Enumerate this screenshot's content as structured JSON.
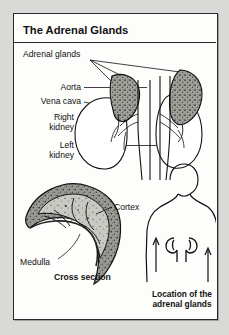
{
  "figure": {
    "title": "The Adrenal Glands",
    "background_color": "#d9d9d7",
    "panel_color": "#fdfdfc",
    "ink_color": "#111111",
    "tissue_fill": "#9a9a96"
  },
  "labels": {
    "adrenal_glands": "Adrenal glands",
    "aorta": "Aorta",
    "vena_cava": "Vena cava",
    "right_kidney_line1": "Right",
    "right_kidney_line2": "kidney",
    "left_kidney_line1": "Left",
    "left_kidney_line2": "kidney",
    "cortex": "Cortex",
    "medulla": "Medulla"
  },
  "captions": {
    "cross_section": "Cross section",
    "location_line1": "Location of the",
    "location_line2": "adrenal glands"
  },
  "diagram_parts": [
    "adrenal-gland-right",
    "adrenal-gland-left",
    "kidney-right",
    "kidney-left",
    "aorta-vessel",
    "vena-cava-vessel",
    "adrenal-cross-section",
    "torso-figure",
    "torso-kidney-left",
    "torso-kidney-right"
  ]
}
